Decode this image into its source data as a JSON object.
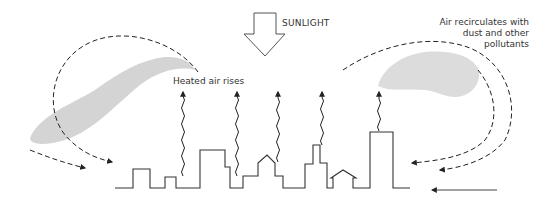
{
  "diagram": {
    "type": "urban-heat-island-air-circulation",
    "labels": {
      "sunlight": "SUNLIGHT",
      "heated_air": "Heated air rises",
      "recirculation": [
        "Air recirculates with",
        "dust and other",
        "pollutants"
      ]
    },
    "elements": {
      "sunlight_arrow": "hollow downward arrow",
      "skyline": "city silhouette outline",
      "heat_arrows_count": 5,
      "pollution_clouds": 2,
      "recirculation_arrows": 4,
      "incoming_wind_arrow": "solid arrow from right"
    },
    "colors": {
      "line": "#333333",
      "cloud": "#d4d4d4",
      "background": "#ffffff"
    }
  }
}
